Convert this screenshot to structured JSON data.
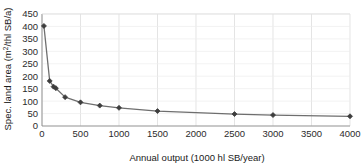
{
  "chart_data": {
    "type": "line",
    "title": "",
    "subtitle": "",
    "xlabel": "Annual output (1000 hl SB/year)",
    "ylabel": "Spec. land area (m2/thl SB/a)",
    "ylabel_parts": {
      "prefix": "Spec. land area (m",
      "superscript": "2",
      "suffix": "/thl SB/a)"
    },
    "xlim": [
      0,
      4000
    ],
    "ylim": [
      0,
      450
    ],
    "xticks": [
      0,
      500,
      1000,
      1500,
      2000,
      2500,
      3000,
      3500,
      4000
    ],
    "yticks": [
      0,
      50,
      100,
      150,
      200,
      250,
      300,
      350,
      400,
      450
    ],
    "xticklabels": [
      "0",
      "500",
      "1000",
      "1500",
      "2000",
      "2500",
      "3000",
      "3500",
      "4000"
    ],
    "yticklabels": [
      "0",
      "50",
      "100",
      "150",
      "200",
      "250",
      "300",
      "350",
      "400",
      "450"
    ],
    "grid": {
      "vertical": true,
      "horizontal": true,
      "color": "#d9d9d9"
    },
    "legend": {
      "visible": false,
      "position": "none"
    },
    "series": [
      {
        "name": "Specific land area",
        "marker": "diamond",
        "marker_color": "#3d3d3d",
        "line_color": "#6e6e6e",
        "x": [
          25,
          100,
          150,
          180,
          300,
          500,
          750,
          1000,
          1500,
          2500,
          3000,
          4000
        ],
        "y": [
          402,
          181,
          158,
          152,
          116,
          95,
          82,
          73,
          60,
          48,
          44,
          39
        ]
      }
    ],
    "colors": {
      "line": "#6e6e6e",
      "marker": "#3d3d3d",
      "grid": "#d9d9d9",
      "axis": "#8c8c8c",
      "text": "#1a1a1a",
      "background": "#ffffff"
    }
  }
}
